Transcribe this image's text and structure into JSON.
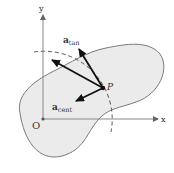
{
  "diagram": {
    "axes": {
      "x_label": "x",
      "y_label": "y",
      "origin_label": "O"
    },
    "point_label": "P",
    "vectors": {
      "tangential": {
        "symbol": "a",
        "subscript": "tan"
      },
      "centripetal": {
        "symbol": "a",
        "subscript": "cent"
      }
    },
    "colors": {
      "region_fill": "#ebebeb",
      "region_stroke": "#7a7a7a",
      "axis": "#888888",
      "vector": "#111111",
      "text": "#333333"
    }
  }
}
